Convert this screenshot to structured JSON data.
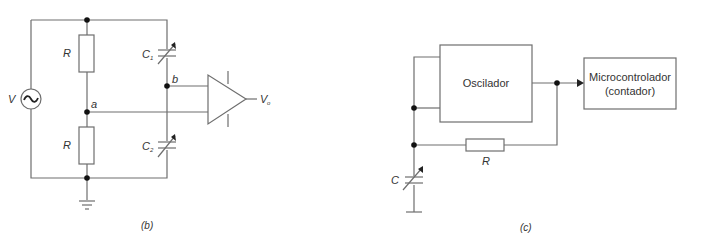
{
  "figure_b": {
    "caption": "(b)",
    "source_label": "V",
    "source_symbol": "~",
    "resistor_top_label": "R",
    "resistor_bottom_label": "R",
    "cap_top_label": "C",
    "cap_top_sub": "1",
    "cap_bottom_label": "C",
    "cap_bottom_sub": "2",
    "node_a_label": "a",
    "node_b_label": "b",
    "output_label": "V",
    "output_sub": "o"
  },
  "figure_c": {
    "caption": "(c)",
    "oscillator_label": "Oscilador",
    "micro_label_line1": "Microcontrolador",
    "micro_label_line2": "(contador)",
    "resistor_label": "R",
    "capacitor_label": "C"
  }
}
